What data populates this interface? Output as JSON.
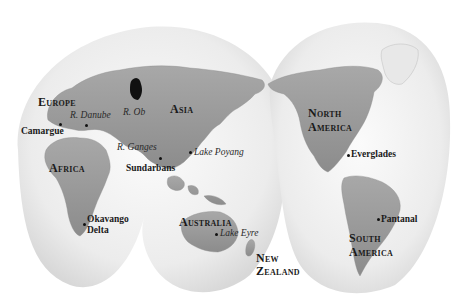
{
  "map": {
    "projection": "interrupted-two-lobe",
    "colors": {
      "background": "#ffffff",
      "ocean": "#efefef",
      "land": "#9a9a9a",
      "land_dark": "#7a7a7a",
      "highlight": "#111111",
      "text": "#1a1a1a"
    },
    "regions": [
      {
        "id": "europe",
        "label": "Europe",
        "x": 38,
        "y": 96
      },
      {
        "id": "asia",
        "label": "Asia",
        "x": 170,
        "y": 103
      },
      {
        "id": "africa",
        "label": "Africa",
        "x": 49,
        "y": 162
      },
      {
        "id": "australia",
        "label": "Australia",
        "x": 179,
        "y": 216
      },
      {
        "id": "new-zealand",
        "label": "New\nZealand",
        "x": 256,
        "y": 252
      },
      {
        "id": "north-america",
        "label": "North\nAmerica",
        "x": 308,
        "y": 107
      },
      {
        "id": "south-america",
        "label": "South\nAmerica",
        "x": 349,
        "y": 232
      }
    ],
    "places": [
      {
        "id": "camargue",
        "label": "Camargue",
        "x": 21,
        "y": 127,
        "dot": [
          60,
          124
        ]
      },
      {
        "id": "sundarbans",
        "label": "Sundarbans",
        "x": 126,
        "y": 164,
        "dot": [
          160,
          158
        ]
      },
      {
        "id": "okavango",
        "label": "Okavango\nDelta",
        "x": 87,
        "y": 214,
        "dot": [
          84,
          224
        ]
      },
      {
        "id": "everglades",
        "label": "Everglades",
        "x": 351,
        "y": 150,
        "dot": [
          348,
          155
        ]
      },
      {
        "id": "pantanal",
        "label": "Pantanal",
        "x": 381,
        "y": 215,
        "dot": [
          378,
          219
        ]
      }
    ],
    "water_features": [
      {
        "id": "r-danube",
        "label": "R. Danube",
        "x": 70,
        "y": 111,
        "dot": [
          86,
          125
        ]
      },
      {
        "id": "r-ob",
        "label": "R. Ob",
        "x": 123,
        "y": 108
      },
      {
        "id": "r-ganges",
        "label": "R. Ganges",
        "x": 117,
        "y": 143
      },
      {
        "id": "lake-poyang",
        "label": "Lake Poyang",
        "x": 194,
        "y": 148,
        "dot": [
          190,
          152
        ]
      },
      {
        "id": "lake-eyre",
        "label": "Lake Eyre",
        "x": 220,
        "y": 229,
        "dot": [
          216,
          234
        ]
      }
    ]
  }
}
